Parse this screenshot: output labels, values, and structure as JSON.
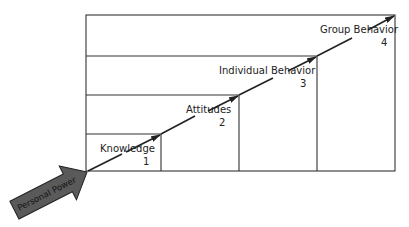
{
  "diagram": {
    "type": "staircase-progression",
    "input_arrow": {
      "label": "Personal Power",
      "color": "#5a5a5a"
    },
    "steps": [
      {
        "label": "Knowledge",
        "number": "1"
      },
      {
        "label": "Attitudes",
        "number": "2"
      },
      {
        "label": "Individual Behavior",
        "number": "3"
      },
      {
        "label": "Group Behavior",
        "number": "4"
      }
    ],
    "line_color": "#222222"
  }
}
